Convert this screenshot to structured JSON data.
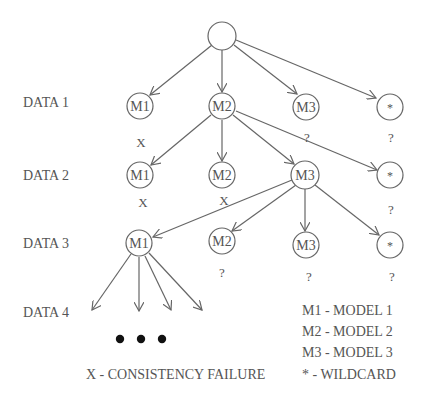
{
  "diagram": {
    "type": "search-tree",
    "row_labels": [
      "DATA 1",
      "DATA 2",
      "DATA 3",
      "DATA 4"
    ],
    "root": {
      "label": ""
    },
    "rows": [
      {
        "row": "DATA 1",
        "nodes": [
          {
            "label": "M1",
            "mark": "X"
          },
          {
            "label": "M2",
            "mark": ""
          },
          {
            "label": "M3",
            "mark": "?"
          },
          {
            "label": "*",
            "mark": "?"
          }
        ]
      },
      {
        "row": "DATA 2",
        "nodes": [
          {
            "label": "M1",
            "mark": "X"
          },
          {
            "label": "M2",
            "mark": "X"
          },
          {
            "label": "M3",
            "mark": ""
          },
          {
            "label": "*",
            "mark": "?"
          }
        ]
      },
      {
        "row": "DATA 3",
        "nodes": [
          {
            "label": "M1",
            "mark": ""
          },
          {
            "label": "M2",
            "mark": "?"
          },
          {
            "label": "M3",
            "mark": "?"
          },
          {
            "label": "*",
            "mark": "?"
          }
        ]
      }
    ],
    "continuation": "• • •",
    "legend": {
      "items": [
        "M1 - MODEL 1",
        "M2 - MODEL 2",
        "M3 - MODEL 3",
        "* - WILDCARD"
      ],
      "failure": "X - CONSISTENCY FAILURE"
    }
  }
}
